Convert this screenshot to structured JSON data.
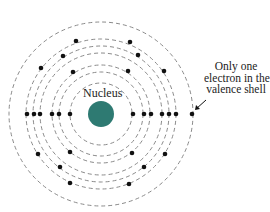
{
  "diagram": {
    "nucleus": {
      "label": "Nucleus",
      "cx": 101,
      "cy": 114,
      "r": 13,
      "color": "#2e7a72"
    },
    "shell_color": "#8a8a8a",
    "electron_color": "#111111",
    "shells": [
      {
        "r": 31,
        "electrons": 2
      },
      {
        "r": 42,
        "electrons": 8
      },
      {
        "r": 49,
        "electrons": 2
      },
      {
        "r": 61,
        "electrons": 8
      },
      {
        "r": 68,
        "electrons": 2
      },
      {
        "r": 75,
        "electrons": 8
      },
      {
        "r": 92,
        "electrons": 1
      }
    ],
    "electrons": [
      [
        27,
        114
      ],
      [
        34,
        114
      ],
      [
        40,
        114
      ],
      [
        52,
        114
      ],
      [
        59,
        114
      ],
      [
        70,
        114
      ],
      [
        133,
        114
      ],
      [
        144,
        114
      ],
      [
        151,
        114
      ],
      [
        162,
        114
      ],
      [
        169,
        114
      ],
      [
        176,
        114
      ],
      [
        192,
        114
      ],
      [
        76,
        41
      ],
      [
        130,
        42
      ],
      [
        63,
        56
      ],
      [
        138,
        55
      ],
      [
        41,
        68
      ],
      [
        73,
        72
      ],
      [
        128,
        71
      ],
      [
        164,
        71
      ],
      [
        38,
        154
      ],
      [
        70,
        152
      ],
      [
        132,
        153
      ],
      [
        165,
        154
      ],
      [
        60,
        167
      ],
      [
        144,
        167
      ],
      [
        70,
        183
      ],
      [
        129,
        184
      ]
    ],
    "annotation": {
      "lines": [
        "Only one",
        "electron in the",
        "valence shell"
      ],
      "arrow_from": [
        206,
        100
      ],
      "arrow_to": [
        194,
        111
      ]
    }
  }
}
